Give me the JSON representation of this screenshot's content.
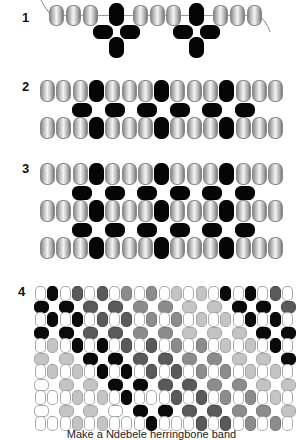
{
  "steps": [
    {
      "label": "1"
    },
    {
      "label": "2"
    },
    {
      "label": "3"
    },
    {
      "label": "4"
    }
  ],
  "step1": {
    "top_row": [
      "G",
      "G",
      "G",
      "K",
      "G",
      "G",
      "G",
      "K",
      "G",
      "G",
      "G"
    ],
    "description": "Thread with grey beads and two black cross motifs"
  },
  "step2": {
    "rows": [
      "GGGKGGGKGGGKGGG",
      " K K K K K K ",
      "GGGKGGGKGGGKGGG"
    ]
  },
  "step3": {
    "rows": [
      "GGGKGGGKGGGKGGG",
      " K K K K K K ",
      "GGGKGGGKGGGKGGG",
      " K K K K K K ",
      "GGGKGGGKGGGKGGG"
    ]
  },
  "step4": {
    "legend": {
      "W": "#ffffff",
      "K": "#0a0a0a",
      "D": "#5a5a5a",
      "M": "#8c8c8c",
      "L": "#c4c4c4"
    },
    "vertical_rows": [
      "WKWDWDWMWMWLWLWKWKWDW",
      "WKWKWDWDWMWMWLWLWKWKW",
      "WLWKWKWDWDWMWMWLWLWKW",
      "WLWLWKWKWDWDWMWMWLWLW",
      "WWWLWLWKWWWDWDWMWMWLW",
      "WWWLWLWWWKWWWDWDWMWMW"
    ],
    "horizontal_rows": [
      "KKDDMMLLKKD",
      "KKDDMMLLLKK",
      "LLKKDDMMLLK",
      "WLLKKDDMMLL",
      "WLLWKKDDMML"
    ]
  },
  "caption": "Make a Ndebele herringbone band"
}
